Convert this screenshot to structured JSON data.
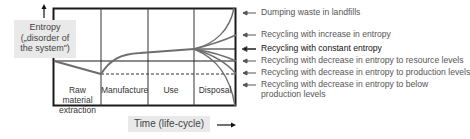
{
  "diagram": {
    "y_axis_label_line1": "Entropy",
    "y_axis_label_line2": "(„disorder of",
    "y_axis_label_line3": "the system\")",
    "x_axis_label": "Time  (life-cycle)",
    "phases": [
      {
        "line1": "Raw material",
        "line2": "extraction"
      },
      {
        "line1": "Manufacture",
        "line2": ""
      },
      {
        "line1": "Use",
        "line2": ""
      },
      {
        "line1": "Disposal",
        "line2": ""
      }
    ],
    "legend": [
      {
        "label": "Dumping waste in landfills",
        "line2": ""
      },
      {
        "label": "Recycling with increase in entropy",
        "line2": ""
      },
      {
        "label": "Recycling with constant entropy",
        "line2": ""
      },
      {
        "label": "Recycling with decrease in entropy to resource levels",
        "line2": ""
      },
      {
        "label": "Recycling with decrease in entropy to production levels",
        "line2": ""
      },
      {
        "label": "Recycling with decrease in entropy to below",
        "line2": "production levels"
      }
    ],
    "colors": {
      "frame": "#1a1a1a",
      "curve": "#6e6e6e",
      "label_bg": "#e9e9e9"
    }
  }
}
